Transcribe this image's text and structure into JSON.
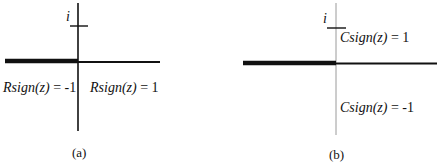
{
  "figure": {
    "panels": [
      {
        "id": "a",
        "caption": "(a)",
        "imag_unit_label": "i",
        "region_labels": [
          {
            "fn": "Rsign",
            "arg": "(z)",
            "rest": " = -1",
            "full": "Rsign(z) = -1",
            "region": "left half-plane"
          },
          {
            "fn": "Rsign",
            "arg": "(z)",
            "rest": " = 1",
            "full": "Rsign(z) = 1",
            "region": "right half-plane"
          }
        ],
        "branch_cut": "negative real axis (thick)",
        "colors": {
          "axis": "#111111",
          "branch_cut": "#111111"
        }
      },
      {
        "id": "b",
        "caption": "(b)",
        "imag_unit_label": "i",
        "region_labels": [
          {
            "fn": "Csign",
            "arg": "(z)",
            "rest": " = 1",
            "full": "Csign(z) = 1",
            "region": "upper half-plane"
          },
          {
            "fn": "Csign",
            "arg": "(z)",
            "rest": " = -1",
            "full": "Csign(z) = -1",
            "region": "lower half-plane"
          }
        ],
        "branch_cut": "negative real axis (thick)",
        "colors": {
          "axis": "#111111",
          "imag_axis": "#9a9a9a",
          "branch_cut": "#111111"
        }
      }
    ]
  }
}
